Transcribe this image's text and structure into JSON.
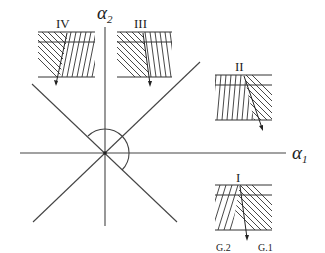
{
  "figure": {
    "axes": {
      "x_label": "α",
      "x_sub": "1",
      "y_label": "α",
      "y_sub": "2"
    },
    "regions": [
      {
        "id": "I",
        "label": "I",
        "grain_labels": [
          "G.2",
          "G.1"
        ]
      },
      {
        "id": "II",
        "label": "II"
      },
      {
        "id": "III",
        "label": "III"
      },
      {
        "id": "IV",
        "label": "IV"
      }
    ],
    "colors": {
      "line": "#444444",
      "background": "#ffffff"
    }
  }
}
